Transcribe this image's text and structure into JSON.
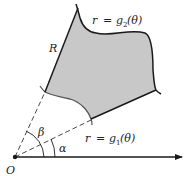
{
  "diagram": {
    "colors": {
      "region_fill": "#c8c8c8",
      "stroke": "#1a1a1a",
      "background": "#ffffff"
    },
    "labels": {
      "region": "R",
      "outer_curve_lhs": "r",
      "outer_curve_eq": "=",
      "outer_curve_fn": "g",
      "outer_curve_sub": "2",
      "outer_curve_arg": "(θ)",
      "inner_curve_lhs": "r",
      "inner_curve_eq": "=",
      "inner_curve_fn": "g",
      "inner_curve_sub": "1",
      "inner_curve_arg": "(θ)",
      "angle_alpha": "α",
      "angle_beta": "β",
      "origin": "O"
    },
    "elements": {
      "origin_point": [
        15,
        157
      ],
      "polar_axis": {
        "from": [
          15,
          157
        ],
        "to": [
          184,
          157
        ]
      },
      "ray_beta": {
        "from": [
          15,
          157
        ],
        "to": [
          45,
          92
        ]
      },
      "ray_alpha": {
        "from": [
          15,
          157
        ],
        "to": [
          91,
          120
        ]
      }
    }
  }
}
